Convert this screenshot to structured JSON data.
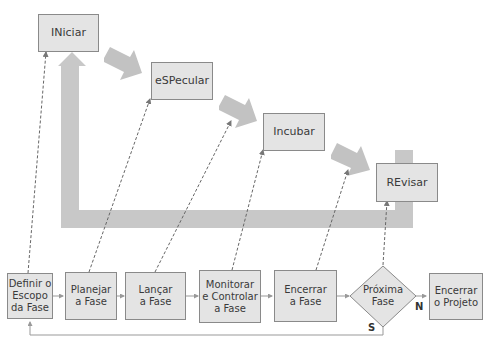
{
  "phases": {
    "iniciar": "INiciar",
    "especular": "eSPecular",
    "incubar": "Incubar",
    "revisar": "REvisar"
  },
  "process": {
    "definir": "Definir o\nEscopo\nda Fase",
    "planejar": "Planejar\na Fase",
    "lancar": "Lançar\na Fase",
    "monitorar": "Monitorar\ne Controlar\na Fase",
    "encerrar_fase": "Encerrar\na Fase",
    "proxima_fase": "Próxima\nFase",
    "encerrar_projeto": "Encerrar\no Projeto"
  },
  "labels": {
    "no": "N",
    "yes": "S"
  },
  "colors": {
    "box_fill": "#e4e4e4",
    "box_border": "#8a8a8a",
    "big_arrow": "#c8c8c8",
    "line": "#8a8a8a"
  }
}
